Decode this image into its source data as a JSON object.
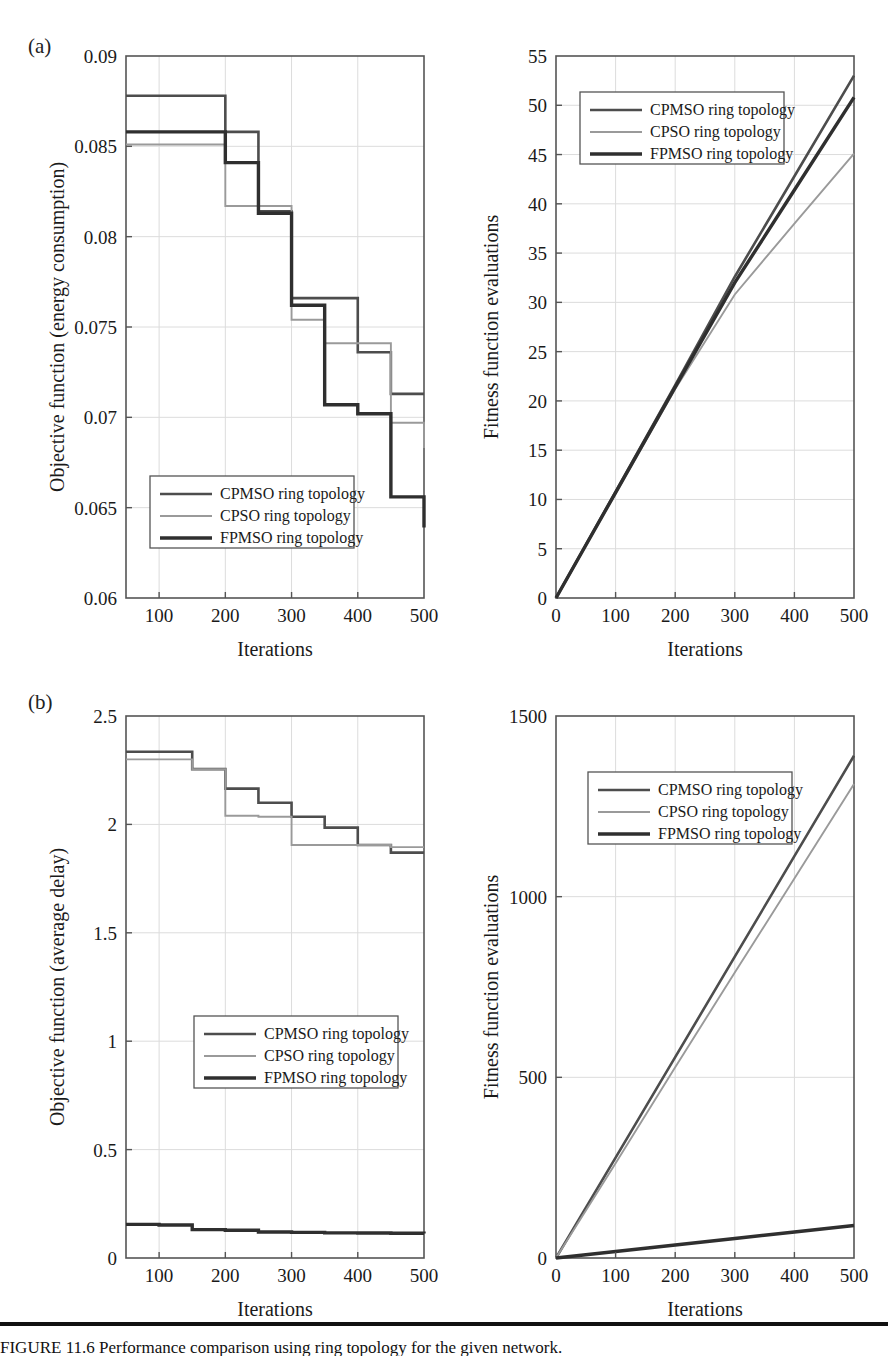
{
  "figure": {
    "panel_a_label": "(a)",
    "panel_b_label": "(b)",
    "caption_text": "FIGURE 11.6   Performance comparison using ring topology for the given network."
  },
  "series_names": {
    "cpmso": "CPMSO ring topology",
    "cpso": "CPSO ring topology",
    "fpmso": "FPMSO ring topology"
  },
  "colors": {
    "cpmso": "#4d4d4d",
    "cpso": "#9a9a9a",
    "fpmso": "#2f2f2f",
    "axis": "#555555",
    "grid": "#dcdcdc",
    "text": "#1a1a1a"
  },
  "chart_data": [
    {
      "id": "a-left",
      "type": "line",
      "subplot": "(a)",
      "title": "",
      "xlabel": "Iterations",
      "ylabel": "Objective function (energy consumption)",
      "xlim": [
        50,
        500
      ],
      "ylim": [
        0.06,
        0.09
      ],
      "xticks": [
        100,
        200,
        300,
        400,
        500
      ],
      "yticks": [
        0.06,
        0.065,
        0.07,
        0.075,
        0.08,
        0.085,
        0.09
      ],
      "ytick_labels": [
        "0.06",
        "0.065",
        "0.07",
        "0.075",
        "0.08",
        "0.085",
        "0.09"
      ],
      "xtick_labels": [
        "100",
        "200",
        "300",
        "400",
        "500"
      ],
      "grid": true,
      "step": true,
      "legend_position": "lower-left",
      "x": [
        50,
        100,
        150,
        200,
        250,
        300,
        350,
        400,
        450,
        500
      ],
      "series": [
        {
          "name": "CPMSO ring topology",
          "key": "cpmso",
          "values": [
            0.0878,
            0.0878,
            0.0878,
            0.0858,
            0.0814,
            0.0766,
            0.0766,
            0.0736,
            0.0713,
            0.0713
          ]
        },
        {
          "name": "CPSO ring topology",
          "key": "cpso",
          "values": [
            0.0851,
            0.0851,
            0.0851,
            0.0817,
            0.0817,
            0.0754,
            0.0741,
            0.0741,
            0.0697,
            0.0683
          ]
        },
        {
          "name": "FPMSO ring topology",
          "key": "fpmso",
          "values": [
            0.0858,
            0.0858,
            0.0858,
            0.0841,
            0.0813,
            0.0762,
            0.0707,
            0.0702,
            0.0656,
            0.0639
          ]
        }
      ]
    },
    {
      "id": "a-right",
      "type": "line",
      "subplot": "(a)",
      "title": "",
      "xlabel": "Iterations",
      "ylabel": "Fitness function evaluations",
      "xlim": [
        0,
        500
      ],
      "ylim": [
        0,
        55
      ],
      "xticks": [
        0,
        100,
        200,
        300,
        400,
        500
      ],
      "yticks": [
        0,
        5,
        10,
        15,
        20,
        25,
        30,
        35,
        40,
        45,
        50,
        55
      ],
      "ytick_labels": [
        "0",
        "5",
        "10",
        "15",
        "20",
        "25",
        "30",
        "35",
        "40",
        "45",
        "50",
        "55"
      ],
      "xtick_labels": [
        "0",
        "100",
        "200",
        "300",
        "400",
        "500"
      ],
      "grid": true,
      "step": false,
      "legend_position": "upper-left",
      "x": [
        0,
        100,
        200,
        300,
        400,
        500
      ],
      "series": [
        {
          "name": "CPMSO ring topology",
          "key": "cpmso",
          "values": [
            0,
            10.8,
            21.6,
            32.6,
            42.8,
            53.0
          ]
        },
        {
          "name": "CPSO ring topology",
          "key": "cpso",
          "values": [
            0,
            10.6,
            21.2,
            30.8,
            38.0,
            45.1
          ]
        },
        {
          "name": "FPMSO ring topology",
          "key": "fpmso",
          "values": [
            0,
            10.7,
            21.4,
            32.0,
            41.4,
            50.8
          ]
        }
      ]
    },
    {
      "id": "b-left",
      "type": "line",
      "subplot": "(b)",
      "title": "",
      "xlabel": "Iterations",
      "ylabel": "Objective function (average delay)",
      "xlim": [
        50,
        500
      ],
      "ylim": [
        0,
        2.5
      ],
      "xticks": [
        100,
        200,
        300,
        400,
        500
      ],
      "yticks": [
        0,
        0.5,
        1,
        1.5,
        2,
        2.5
      ],
      "ytick_labels": [
        "0",
        "0.5",
        "1",
        "1.5",
        "2",
        "2.5"
      ],
      "xtick_labels": [
        "100",
        "200",
        "300",
        "400",
        "500"
      ],
      "grid": true,
      "step": true,
      "legend_position": "middle-left",
      "x": [
        50,
        100,
        150,
        200,
        250,
        300,
        350,
        400,
        450,
        500
      ],
      "series": [
        {
          "name": "CPMSO ring topology",
          "key": "cpmso",
          "values": [
            2.335,
            2.335,
            2.255,
            2.165,
            2.1,
            2.035,
            1.985,
            1.905,
            1.87,
            1.87
          ]
        },
        {
          "name": "CPSO ring topology",
          "key": "cpso",
          "values": [
            2.3,
            2.3,
            2.255,
            2.04,
            2.035,
            1.905,
            1.905,
            1.905,
            1.895,
            1.895
          ]
        },
        {
          "name": "FPMSO ring topology",
          "key": "fpmso",
          "values": [
            0.155,
            0.152,
            0.131,
            0.128,
            0.12,
            0.118,
            0.116,
            0.115,
            0.114,
            0.113
          ]
        }
      ]
    },
    {
      "id": "b-right",
      "type": "line",
      "subplot": "(b)",
      "title": "",
      "xlabel": "Iterations",
      "ylabel": "Fitness function evaluations",
      "xlim": [
        0,
        500
      ],
      "ylim": [
        0,
        1500
      ],
      "xticks": [
        0,
        100,
        200,
        300,
        400,
        500
      ],
      "yticks": [
        0,
        500,
        1000,
        1500
      ],
      "ytick_labels": [
        "0",
        "500",
        "1000",
        "1500"
      ],
      "xtick_labels": [
        "0",
        "100",
        "200",
        "300",
        "400",
        "500"
      ],
      "grid": true,
      "step": false,
      "legend_position": "upper-left",
      "x": [
        0,
        100,
        200,
        300,
        400,
        500
      ],
      "series": [
        {
          "name": "CPMSO ring topology",
          "key": "cpmso",
          "values": [
            0,
            278,
            556,
            834,
            1112,
            1390
          ]
        },
        {
          "name": "CPSO ring topology",
          "key": "cpso",
          "values": [
            0,
            262,
            528,
            790,
            1050,
            1312
          ]
        },
        {
          "name": "FPMSO ring topology",
          "key": "fpmso",
          "values": [
            0,
            18,
            36,
            54,
            72,
            90
          ]
        }
      ]
    }
  ]
}
